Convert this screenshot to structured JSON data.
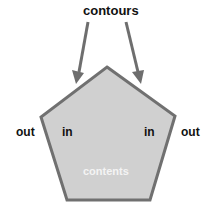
{
  "title": "contours",
  "labels": {
    "out_left": "out",
    "in_left": "in",
    "in_right": "in",
    "out_right": "out",
    "contents": "contents"
  },
  "colors": {
    "fill": "#d0d0d0",
    "stroke": "#707070",
    "arrow": "#6e6e6e",
    "text": "#111111",
    "contents_text": "#f4f4f4"
  },
  "shape": "pentagon",
  "arrows": 2
}
